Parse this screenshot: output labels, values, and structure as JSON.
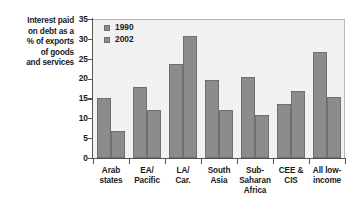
{
  "chart_data": {
    "type": "bar",
    "title": "",
    "xlabel": "",
    "ylabel": "Interest paid on debt as a % of exports of goods and services",
    "ylabel_lines": [
      "Interest paid",
      "on debt as a",
      "% of exports",
      "of goods",
      "and services"
    ],
    "categories": [
      "Arab states",
      "EA/Pacific",
      "LA/Car.",
      "South Asia",
      "Sub-Saharan Africa",
      "CEE & CIS",
      "All low-income"
    ],
    "category_lines": [
      [
        "Arab",
        "states"
      ],
      [
        "EA/",
        "Pacific"
      ],
      [
        "LA/",
        "Car."
      ],
      [
        "South",
        "Asia"
      ],
      [
        "Sub-",
        "Saharan",
        "Africa"
      ],
      [
        "CEE &",
        "CIS"
      ],
      [
        "All low-",
        "income"
      ]
    ],
    "series": [
      {
        "name": "1990",
        "values": [
          15.0,
          17.9,
          23.7,
          19.6,
          20.3,
          13.7,
          26.8
        ]
      },
      {
        "name": "2002",
        "values": [
          6.7,
          12.2,
          30.8,
          12.1,
          10.8,
          17.0,
          15.3
        ]
      }
    ],
    "ylim": [
      0,
      35
    ],
    "yticks": [
      0,
      5,
      10,
      15,
      20,
      25,
      30,
      35
    ],
    "ytick_labels": [
      "0",
      "5",
      "10",
      "15",
      "20",
      "25",
      "30",
      "35"
    ],
    "grid": false,
    "legend_position": "top-left",
    "bar_color": "#8c8c8c",
    "plot_background": "#f1f1f1",
    "axis_color": "#555555"
  }
}
